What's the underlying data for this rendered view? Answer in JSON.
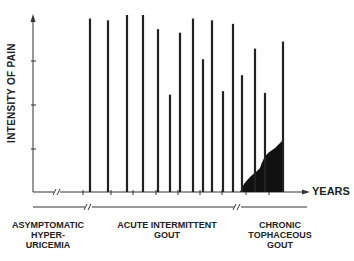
{
  "chart_data": {
    "type": "bar",
    "title": "",
    "ylabel": "INTENSITY OF PAIN",
    "xlabel": "YEARS",
    "ylim": [
      0,
      100
    ],
    "grid": false,
    "y_ticks_unlabeled": [
      25,
      50,
      75
    ],
    "x_axis_break_after_origin": true,
    "bars": {
      "description": "Acute gout attacks (vertical spikes of pain intensity over time)",
      "x_px": [
        90,
        108,
        127,
        143,
        158,
        170,
        180,
        193,
        203,
        212,
        223,
        233,
        242,
        255,
        265,
        283
      ],
      "values": [
        98,
        97,
        100,
        100,
        92,
        55,
        90,
        98,
        75,
        97,
        57,
        95,
        66,
        81,
        56,
        85
      ]
    },
    "area": {
      "description": "Persistent baseline chronic pain (filled black) in chronic tophaceous gout phase",
      "x_px": [
        240,
        250,
        258,
        266,
        275,
        283
      ],
      "values": [
        0,
        10,
        17,
        24,
        27,
        30
      ]
    },
    "phases": [
      {
        "label": "ASYMPTOMATIC HYPER- URICEMIA",
        "lines": [
          "ASYMPTOMATIC",
          "HYPER-",
          "URICEMIA"
        ]
      },
      {
        "label": "ACUTE INTERMITTENT GOUT",
        "lines": [
          "ACUTE INTERMITTENT",
          "GOUT"
        ]
      },
      {
        "label": "CHRONIC TOPHACEOUS GOUT",
        "lines": [
          "CHRONIC",
          "TOPHACEOUS",
          "GOUT"
        ]
      }
    ]
  },
  "labels": {
    "ylabel": "INTENSITY OF PAIN",
    "xlabel": "YEARS",
    "phase0": [
      "ASYMPTOMATIC",
      "HYPER-",
      "URICEMIA"
    ],
    "phase1": [
      "ACUTE INTERMITTENT",
      "GOUT"
    ],
    "phase2": [
      "CHRONIC",
      "TOPHACEOUS",
      "GOUT"
    ]
  }
}
